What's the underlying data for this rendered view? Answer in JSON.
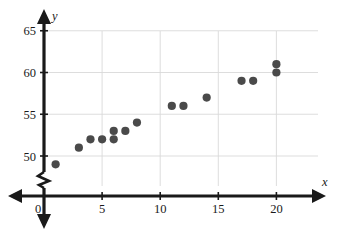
{
  "chart_data": {
    "type": "scatter",
    "title": "",
    "xlabel": "x",
    "ylabel": "y",
    "xlim": [
      0,
      23.2
    ],
    "ylim": [
      47.8,
      66.2
    ],
    "xticks": [
      0,
      5,
      10,
      15,
      20
    ],
    "yticks": [
      50,
      55,
      60,
      65
    ],
    "xtick_labels": [
      "0",
      "5",
      "10",
      "15",
      "20"
    ],
    "ytick_labels": [
      "50",
      "55",
      "60",
      "65"
    ],
    "grid": true,
    "grid_axis": "both",
    "legend": "none",
    "y_axis_break": true,
    "x_axis_arrows": "both",
    "y_axis_arrows": "both",
    "point_color": "#4a4a4a",
    "grid_color": "#d9d9d9",
    "axis_color": "#1a1a1a",
    "points": [
      {
        "x": 1,
        "y": 49
      },
      {
        "x": 3,
        "y": 51
      },
      {
        "x": 4,
        "y": 52
      },
      {
        "x": 5,
        "y": 52
      },
      {
        "x": 6,
        "y": 53
      },
      {
        "x": 6,
        "y": 52
      },
      {
        "x": 7,
        "y": 53
      },
      {
        "x": 8,
        "y": 54
      },
      {
        "x": 11,
        "y": 56
      },
      {
        "x": 12,
        "y": 56
      },
      {
        "x": 14,
        "y": 57
      },
      {
        "x": 17,
        "y": 59
      },
      {
        "x": 18,
        "y": 59
      },
      {
        "x": 20,
        "y": 61
      },
      {
        "x": 20,
        "y": 60
      }
    ]
  }
}
